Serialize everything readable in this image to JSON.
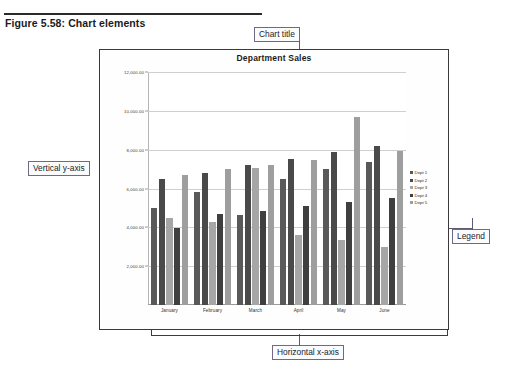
{
  "figure": {
    "caption": "Figure 5.58: Chart elements"
  },
  "annotations": {
    "chart_title": "Chart title",
    "vertical_y_axis": "Vertical y-axis",
    "horizontal_x_axis": "Horizontal x-axis",
    "legend": "Legend"
  },
  "colors": {
    "series": [
      "#595959",
      "#4a4a4a",
      "#a6a6a6",
      "#3f3f3f",
      "#9e9e9e"
    ],
    "grid": "#cfcfcf",
    "frame": "#3a3a3a",
    "annotation_border": "#6e6a86",
    "text": "#1b1b1b"
  },
  "chart_data": {
    "type": "bar",
    "title": "Department Sales",
    "xlabel": "",
    "ylabel": "",
    "categories": [
      "January",
      "February",
      "March",
      "April",
      "May",
      "June"
    ],
    "series": [
      {
        "name": "Dept 1",
        "values": [
          5000,
          5800,
          4650,
          6500,
          7000,
          7350
        ]
      },
      {
        "name": "Dept 2",
        "values": [
          6500,
          6800,
          7200,
          7500,
          7900,
          8200
        ]
      },
      {
        "name": "Dept 3",
        "values": [
          4500,
          4250,
          7050,
          3600,
          3350,
          3000
        ]
      },
      {
        "name": "Dept 4",
        "values": [
          3950,
          4700,
          4850,
          5100,
          5300,
          5500
        ]
      },
      {
        "name": "Dept 5",
        "values": [
          6700,
          7000,
          7200,
          7450,
          9700,
          7950
        ]
      }
    ],
    "ylim": [
      0,
      12000
    ],
    "yticks": [
      2000,
      4000,
      6000,
      8000,
      10000,
      12000
    ],
    "ytick_labels": [
      "2,000.00",
      "4,000.00",
      "6,000.00",
      "8,000.00",
      "10,000.00",
      "12,000.00"
    ],
    "grid": true,
    "legend_position": "right",
    "legend_entries": [
      "Dept 1",
      "Dept 2",
      "Dept 3",
      "Dept 4",
      "Dept 5"
    ]
  }
}
